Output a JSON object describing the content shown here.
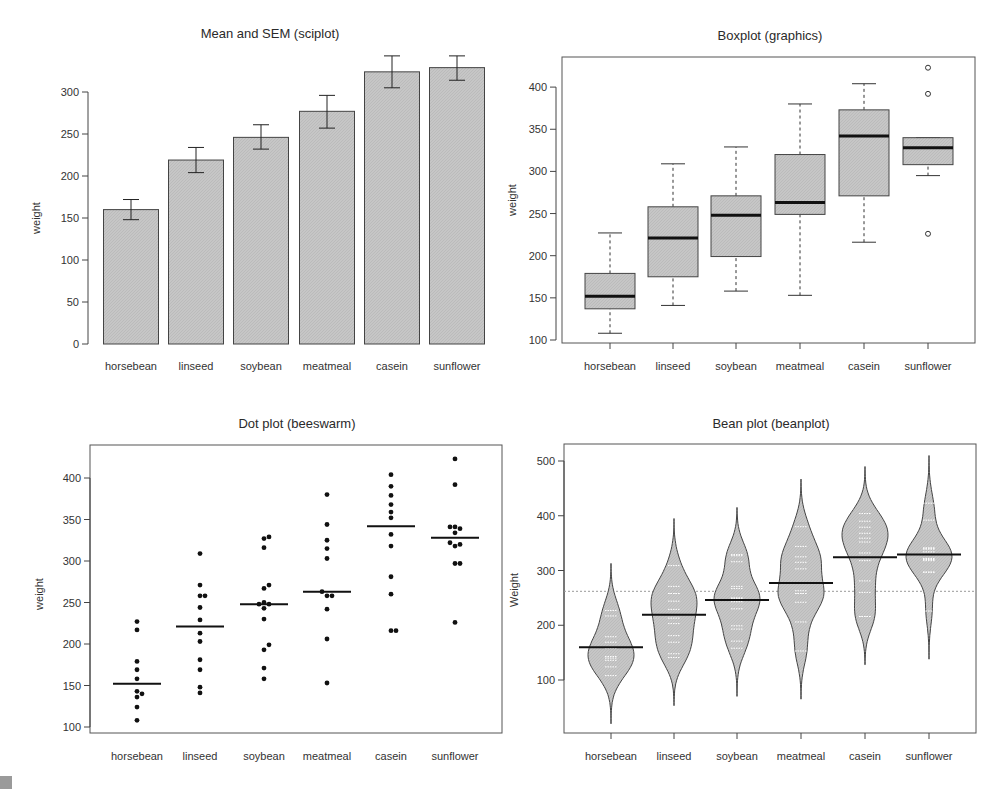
{
  "chart_data": [
    {
      "type": "bar",
      "title": "Mean and SEM (sciplot)",
      "xlabel": "",
      "ylabel": "weight",
      "ylim": [
        0,
        300
      ],
      "yticks": [
        0,
        50,
        100,
        150,
        200,
        250,
        300
      ],
      "categories": [
        "horsebean",
        "linseed",
        "soybean",
        "meatmeal",
        "casein",
        "sunflower"
      ],
      "values": [
        160,
        219,
        246,
        277,
        324,
        329
      ],
      "error_low": [
        148,
        204,
        232,
        257,
        305,
        314
      ],
      "error_high": [
        172,
        234,
        261,
        296,
        343,
        343
      ],
      "grid": false
    },
    {
      "type": "box",
      "title": "Boxplot (graphics)",
      "xlabel": "",
      "ylabel": "weight",
      "yticks": [
        100,
        150,
        200,
        250,
        300,
        350,
        400
      ],
      "categories": [
        "horsebean",
        "linseed",
        "soybean",
        "meatmeal",
        "casein",
        "sunflower"
      ],
      "boxes": [
        {
          "whisker_low": 108,
          "q1": 137,
          "median": 152,
          "q3": 179,
          "whisker_high": 227,
          "outliers": []
        },
        {
          "whisker_low": 141,
          "q1": 175,
          "median": 221,
          "q3": 258,
          "whisker_high": 309,
          "outliers": []
        },
        {
          "whisker_low": 158,
          "q1": 199,
          "median": 248,
          "q3": 271,
          "whisker_high": 329,
          "outliers": []
        },
        {
          "whisker_low": 153,
          "q1": 249,
          "median": 263,
          "q3": 320,
          "whisker_high": 380,
          "outliers": []
        },
        {
          "whisker_low": 216,
          "q1": 271,
          "median": 342,
          "q3": 373,
          "whisker_high": 404,
          "outliers": []
        },
        {
          "whisker_low": 295,
          "q1": 308,
          "median": 328,
          "q3": 340,
          "whisker_high": 340,
          "outliers": [
            226,
            392,
            423
          ]
        }
      ]
    },
    {
      "type": "scatter",
      "title": "Dot plot (beeswarm)",
      "xlabel": "",
      "ylabel": "weight",
      "yticks": [
        100,
        150,
        200,
        250,
        300,
        350,
        400
      ],
      "categories": [
        "horsebean",
        "linseed",
        "soybean",
        "meatmeal",
        "casein",
        "sunflower"
      ],
      "medians": [
        152,
        221,
        248,
        263,
        342,
        328
      ],
      "points": [
        [
          108,
          124,
          136,
          140,
          143,
          158,
          169,
          179,
          217,
          227
        ],
        [
          141,
          148,
          169,
          181,
          203,
          213,
          229,
          244,
          258,
          258,
          271,
          309
        ],
        [
          158,
          171,
          193,
          199,
          230,
          243,
          248,
          248,
          250,
          267,
          271,
          316,
          327,
          329
        ],
        [
          153,
          206,
          242,
          258,
          258,
          263,
          303,
          315,
          325,
          344,
          380
        ],
        [
          216,
          216,
          260,
          281,
          318,
          332,
          352,
          359,
          368,
          379,
          390,
          404
        ],
        [
          226,
          297,
          297,
          318,
          320,
          322,
          334,
          339,
          341,
          341,
          392,
          423
        ]
      ]
    },
    {
      "type": "violin",
      "title": "Bean plot (beanplot)",
      "xlabel": "",
      "ylabel": "Weight",
      "yticks": [
        100,
        200,
        300,
        400,
        500
      ],
      "overall_mean_line": 262,
      "categories": [
        "horsebean",
        "linseed",
        "soybean",
        "meatmeal",
        "casein",
        "sunflower"
      ],
      "means": [
        160,
        219,
        246,
        277,
        324,
        329
      ],
      "density_range": [
        [
          20,
          313
        ],
        [
          53,
          395
        ],
        [
          70,
          415
        ],
        [
          65,
          467
        ],
        [
          128,
          490
        ],
        [
          138,
          510
        ]
      ]
    }
  ],
  "panels": {
    "bar": {
      "title": "Mean and SEM (sciplot)",
      "ylabel": "weight"
    },
    "box": {
      "title": "Boxplot (graphics)",
      "ylabel": "weight"
    },
    "dot": {
      "title": "Dot plot (beeswarm)",
      "ylabel": "weight"
    },
    "bean": {
      "title": "Bean plot (beanplot)",
      "ylabel": "Weight"
    }
  },
  "categories": [
    "horsebean",
    "linseed",
    "soybean",
    "meatmeal",
    "casein",
    "sunflower"
  ],
  "ticks": {
    "bar": [
      "0",
      "50",
      "100",
      "150",
      "200",
      "250",
      "300"
    ],
    "box": [
      "100",
      "150",
      "200",
      "250",
      "300",
      "350",
      "400"
    ],
    "dot": [
      "100",
      "150",
      "200",
      "250",
      "300",
      "350",
      "400"
    ],
    "bean": [
      "100",
      "200",
      "300",
      "400",
      "500"
    ]
  },
  "colors": {
    "fill": "#c4c4c4",
    "stroke": "#333333",
    "frame": "#555555",
    "median": "#111111"
  }
}
